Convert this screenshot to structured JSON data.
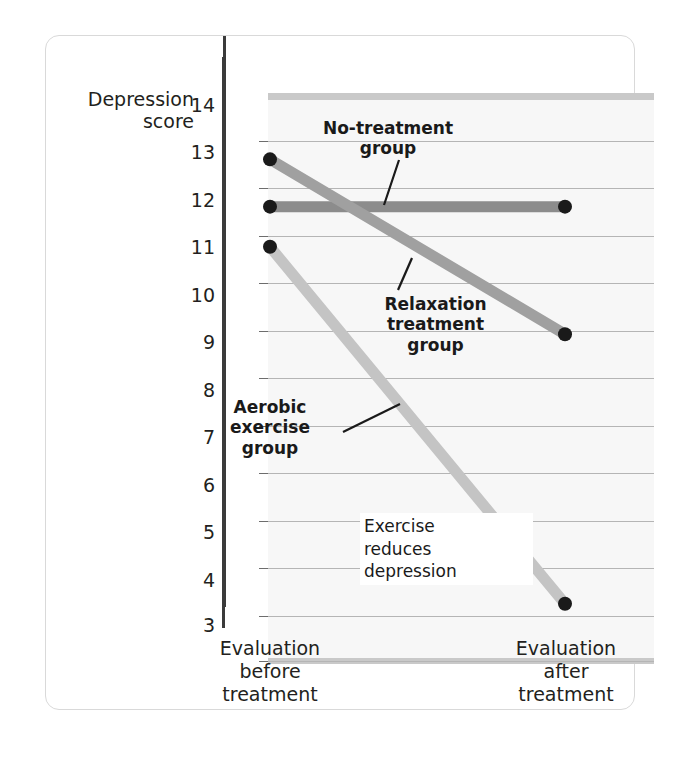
{
  "chart_data": {
    "type": "line",
    "title": "",
    "ylabel_line1": "Depression",
    "ylabel_line2": "score",
    "xlabel": "",
    "categories": [
      "Evaluation before treatment",
      "Evaluation after treatment"
    ],
    "x_tick_labels": [
      {
        "line1": "Evaluation",
        "line2": "before",
        "line3": "treatment"
      },
      {
        "line1": "Evaluation",
        "line2": "after",
        "line3": "treatment"
      }
    ],
    "ylim": [
      3,
      14
    ],
    "y_ticks": [
      14,
      13,
      12,
      11,
      10,
      9,
      8,
      7,
      6,
      5,
      4,
      3
    ],
    "grid": true,
    "legend_position": "inline-annotations",
    "series": [
      {
        "name": "No-treatment group",
        "values": [
          11.85,
          11.85
        ],
        "color": "#8c8c8c",
        "annotation": {
          "line1": "No-treatment",
          "line2": "group"
        }
      },
      {
        "name": "Relaxation treatment group",
        "values": [
          12.85,
          9.15
        ],
        "color": "#a0a0a0",
        "annotation": {
          "line1": "Relaxation",
          "line2": "treatment",
          "line3": "group"
        }
      },
      {
        "name": "Aerobic exercise group",
        "values": [
          11.0,
          3.45
        ],
        "color": "#c4c4c4",
        "annotation": {
          "line1": "Aerobic",
          "line2": "exercise",
          "line3": "group"
        }
      }
    ],
    "annotations": [
      {
        "text_line1": "Exercise",
        "text_line2": "reduces",
        "text_line3": "depression"
      }
    ],
    "marker_color": "#1a1a1a",
    "plot_background": "#f7f7f7",
    "gridline_color": "#b5b5b5",
    "axis_color": "#3b3b3b"
  },
  "axis_title": {
    "line1": "Depression",
    "line2": "score"
  },
  "y_ticks": {
    "t14": "14",
    "t13": "13",
    "t12": "12",
    "t11": "11",
    "t10": "10",
    "t9": "9",
    "t8": "8",
    "t7": "7",
    "t6": "6",
    "t5": "5",
    "t4": "4",
    "t3": "3"
  },
  "x_labels": {
    "before_l1": "Evaluation",
    "before_l2": "before",
    "before_l3": "treatment",
    "after_l1": "Evaluation",
    "after_l2": "after",
    "after_l3": "treatment"
  },
  "annotations": {
    "no_treatment_l1": "No-treatment",
    "no_treatment_l2": "group",
    "relaxation_l1": "Relaxation",
    "relaxation_l2": "treatment",
    "relaxation_l3": "group",
    "aerobic_l1": "Aerobic",
    "aerobic_l2": "exercise",
    "aerobic_l3": "group",
    "caption_l1": "Exercise",
    "caption_l2": "reduces",
    "caption_l3": "depression"
  }
}
